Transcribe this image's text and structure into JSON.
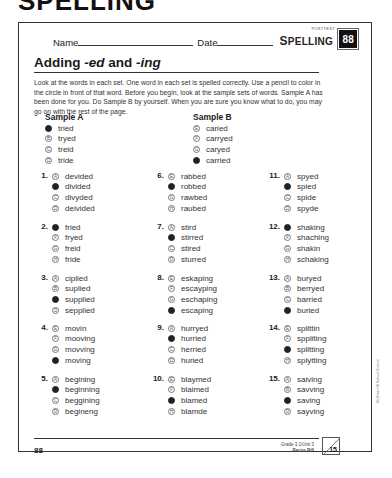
{
  "top_fragment": "SPELLING",
  "header": {
    "name_label": "Name",
    "date_label": "Date",
    "posttest_label": "POSTTEST",
    "subject_first": "S",
    "subject_rest": "PELLING",
    "page_badge": "88"
  },
  "title": {
    "prefix": "Adding ",
    "ed": "-ed",
    "and": " and ",
    "ing": "-ing"
  },
  "instructions": "Look at the words in each set. One word in each set is spelled correctly. Use a pencil to color in the circle in front of that word. Before you begin, look at the sample sets of words. Sample A has been done for you. Do Sample B by yourself. When you are sure you know what to do, you may go on with the rest of the page.",
  "samples": [
    {
      "title": "Sample A",
      "options": [
        {
          "letter": "A",
          "word": "tried",
          "filled": true
        },
        {
          "letter": "B",
          "word": "tryed",
          "filled": false
        },
        {
          "letter": "C",
          "word": "treid",
          "filled": false
        },
        {
          "letter": "D",
          "word": "tride",
          "filled": false
        }
      ]
    },
    {
      "title": "Sample B",
      "options": [
        {
          "letter": "E",
          "word": "caried",
          "filled": false
        },
        {
          "letter": "F",
          "word": "carryed",
          "filled": false
        },
        {
          "letter": "G",
          "word": "caryed",
          "filled": false
        },
        {
          "letter": "H",
          "word": "carried",
          "filled": true
        }
      ]
    }
  ],
  "questions": [
    {
      "num": "1.",
      "options": [
        {
          "letter": "A",
          "word": "devided",
          "filled": false
        },
        {
          "letter": "B",
          "word": "divided",
          "filled": true
        },
        {
          "letter": "C",
          "word": "divyded",
          "filled": false
        },
        {
          "letter": "D",
          "word": "deivided",
          "filled": false
        }
      ]
    },
    {
      "num": "2.",
      "options": [
        {
          "letter": "E",
          "word": "fried",
          "filled": true
        },
        {
          "letter": "F",
          "word": "fryed",
          "filled": false
        },
        {
          "letter": "G",
          "word": "freid",
          "filled": false
        },
        {
          "letter": "H",
          "word": "fride",
          "filled": false
        }
      ]
    },
    {
      "num": "3.",
      "options": [
        {
          "letter": "A",
          "word": "ciplied",
          "filled": false
        },
        {
          "letter": "B",
          "word": "suplied",
          "filled": false
        },
        {
          "letter": "C",
          "word": "supplied",
          "filled": true
        },
        {
          "letter": "D",
          "word": "sepplied",
          "filled": false
        }
      ]
    },
    {
      "num": "4.",
      "options": [
        {
          "letter": "E",
          "word": "movin",
          "filled": false
        },
        {
          "letter": "F",
          "word": "mooving",
          "filled": false
        },
        {
          "letter": "G",
          "word": "movving",
          "filled": false
        },
        {
          "letter": "H",
          "word": "moving",
          "filled": true
        }
      ]
    },
    {
      "num": "5.",
      "options": [
        {
          "letter": "A",
          "word": "begining",
          "filled": false
        },
        {
          "letter": "B",
          "word": "beginning",
          "filled": true
        },
        {
          "letter": "C",
          "word": "beggining",
          "filled": false
        },
        {
          "letter": "D",
          "word": "begineng",
          "filled": false
        }
      ]
    },
    {
      "num": "6.",
      "options": [
        {
          "letter": "E",
          "word": "rabbed",
          "filled": false
        },
        {
          "letter": "F",
          "word": "robbed",
          "filled": true
        },
        {
          "letter": "G",
          "word": "rawbed",
          "filled": false
        },
        {
          "letter": "H",
          "word": "raubed",
          "filled": false
        }
      ]
    },
    {
      "num": "7.",
      "options": [
        {
          "letter": "A",
          "word": "stird",
          "filled": false
        },
        {
          "letter": "B",
          "word": "stirred",
          "filled": true
        },
        {
          "letter": "C",
          "word": "stired",
          "filled": false
        },
        {
          "letter": "D",
          "word": "sturred",
          "filled": false
        }
      ]
    },
    {
      "num": "8.",
      "options": [
        {
          "letter": "E",
          "word": "eskaping",
          "filled": false
        },
        {
          "letter": "F",
          "word": "escayping",
          "filled": false
        },
        {
          "letter": "G",
          "word": "eschaping",
          "filled": false
        },
        {
          "letter": "H",
          "word": "escaping",
          "filled": true
        }
      ]
    },
    {
      "num": "9.",
      "options": [
        {
          "letter": "A",
          "word": "hurryed",
          "filled": false
        },
        {
          "letter": "B",
          "word": "hurried",
          "filled": true
        },
        {
          "letter": "C",
          "word": "herried",
          "filled": false
        },
        {
          "letter": "D",
          "word": "huried",
          "filled": false
        }
      ]
    },
    {
      "num": "10.",
      "options": [
        {
          "letter": "E",
          "word": "blaymed",
          "filled": false
        },
        {
          "letter": "F",
          "word": "blaimed",
          "filled": false
        },
        {
          "letter": "G",
          "word": "blamed",
          "filled": true
        },
        {
          "letter": "H",
          "word": "blamde",
          "filled": false
        }
      ]
    },
    {
      "num": "11.",
      "options": [
        {
          "letter": "A",
          "word": "spyed",
          "filled": false
        },
        {
          "letter": "B",
          "word": "spied",
          "filled": true
        },
        {
          "letter": "C",
          "word": "spide",
          "filled": false
        },
        {
          "letter": "D",
          "word": "spyde",
          "filled": false
        }
      ]
    },
    {
      "num": "12.",
      "options": [
        {
          "letter": "E",
          "word": "shaking",
          "filled": true
        },
        {
          "letter": "F",
          "word": "shaching",
          "filled": false
        },
        {
          "letter": "G",
          "word": "shakin",
          "filled": false
        },
        {
          "letter": "H",
          "word": "schaking",
          "filled": false
        }
      ]
    },
    {
      "num": "13.",
      "options": [
        {
          "letter": "A",
          "word": "buryed",
          "filled": false
        },
        {
          "letter": "B",
          "word": "berryed",
          "filled": false
        },
        {
          "letter": "C",
          "word": "barried",
          "filled": false
        },
        {
          "letter": "D",
          "word": "buried",
          "filled": true
        }
      ]
    },
    {
      "num": "14.",
      "options": [
        {
          "letter": "E",
          "word": "splittin",
          "filled": false
        },
        {
          "letter": "F",
          "word": "sppliting",
          "filled": false
        },
        {
          "letter": "G",
          "word": "splitting",
          "filled": true
        },
        {
          "letter": "H",
          "word": "splytting",
          "filled": false
        }
      ]
    },
    {
      "num": "15.",
      "options": [
        {
          "letter": "A",
          "word": "saiving",
          "filled": false
        },
        {
          "letter": "B",
          "word": "savving",
          "filled": false
        },
        {
          "letter": "C",
          "word": "saving",
          "filled": true
        },
        {
          "letter": "D",
          "word": "sayving",
          "filled": false
        }
      ]
    }
  ],
  "footer": {
    "page_number": "88",
    "grade_unit": "Grade 3.1/Unit 3",
    "story": "Pecos Bill",
    "score_total": "15"
  },
  "side_credit": "McGraw-Hill School Division"
}
